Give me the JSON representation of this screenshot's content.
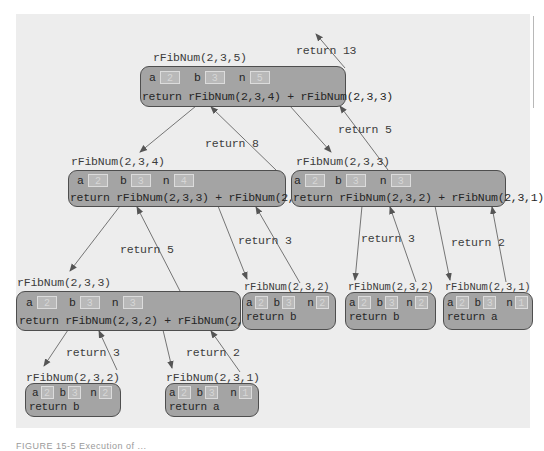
{
  "diagram": {
    "caption": "FIGURE 15-5  Execution of ...",
    "frames": [
      {
        "id": "root",
        "call": "rFibNum(2,3,5)",
        "a": "2",
        "b": "3",
        "n": "5",
        "statement": "return rFibNum(2,3,4) + rFibNum(2,3,3)"
      },
      {
        "id": "n4",
        "call": "rFibNum(2,3,4)",
        "a": "2",
        "b": "3",
        "n": "4",
        "statement": "return rFibNum(2,3,3) + rFibNum(2,3,2)"
      },
      {
        "id": "n3_right",
        "call": "rFibNum(2,3,3)",
        "a": "2",
        "b": "3",
        "n": "3",
        "statement": "return rFibNum(2,3,2) + rFibNum(2,3,1)"
      },
      {
        "id": "n3_left",
        "call": "rFibNum(2,3,3)",
        "a": "2",
        "b": "3",
        "n": "3",
        "statement": "return rFibNum(2,3,2) + rFibNum(2,3,1)"
      },
      {
        "id": "n2_a",
        "call": "rFibNum(2,3,2)",
        "a": "2",
        "b": "3",
        "n": "2",
        "statement": "return b"
      },
      {
        "id": "n2_b",
        "call": "rFibNum(2,3,2)",
        "a": "2",
        "b": "3",
        "n": "2",
        "statement": "return b"
      },
      {
        "id": "n1_a",
        "call": "rFibNum(2,3,1)",
        "a": "2",
        "b": "3",
        "n": "1",
        "statement": "return a"
      },
      {
        "id": "n2_c",
        "call": "rFibNum(2,3,2)",
        "a": "2",
        "b": "3",
        "n": "2",
        "statement": "return b"
      },
      {
        "id": "n1_b",
        "call": "rFibNum(2,3,1)",
        "a": "2",
        "b": "3",
        "n": "1",
        "statement": "return a"
      }
    ],
    "var_labels": {
      "a": "a",
      "b": "b",
      "n": "n"
    },
    "returns": {
      "root": "return 13",
      "n4": "return 8",
      "n3_right": "return 5",
      "n3_left": "return 5",
      "n2_a": "return 3",
      "n2_b": "return 3",
      "n1_a": "return 2",
      "n2_c": "return 3",
      "n1_b": "return 2"
    },
    "colors": {
      "panel": "#ededed",
      "frame": "#a4a4a4",
      "frame_border": "#4e4e4e",
      "arrow": "#555555"
    }
  }
}
